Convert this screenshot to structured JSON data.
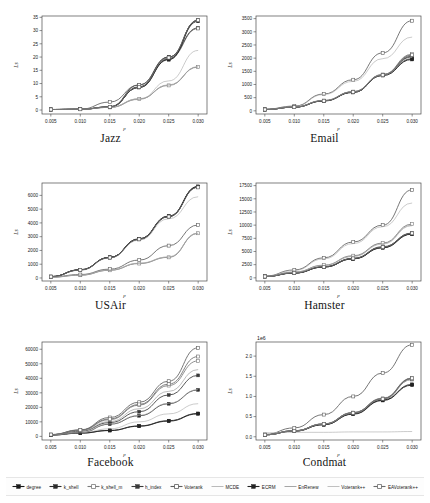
{
  "figure": {
    "xlabel": "p",
    "ylabel": "L_s",
    "xticks": [
      "0.005",
      "0.010",
      "0.015",
      "0.020",
      "0.025",
      "0.030"
    ],
    "x_values": [
      0.005,
      0.01,
      0.015,
      0.02,
      0.025,
      0.03
    ]
  },
  "legend": {
    "position": "bottom",
    "entries": [
      {
        "label": "degree",
        "marker": "plus-filled",
        "color": "#1a1a1a"
      },
      {
        "label": "k_shell",
        "marker": "plus-filled",
        "color": "#2b2b2b"
      },
      {
        "label": "k_shell_m",
        "marker": "plus-open",
        "color": "#7c7c7c"
      },
      {
        "label": "h_index",
        "marker": "plus-filled",
        "color": "#3a3a3a"
      },
      {
        "label": "Voterank",
        "marker": "plus-open",
        "color": "#5e5e5e"
      },
      {
        "label": "MCDE",
        "marker": "line",
        "color": "#a8a8a8"
      },
      {
        "label": "ECRM",
        "marker": "plus-filled",
        "color": "#222222"
      },
      {
        "label": "EnRenew",
        "marker": "line",
        "color": "#8f8f8f"
      },
      {
        "label": "Voterank++",
        "marker": "line",
        "color": "#b0b0b0"
      },
      {
        "label": "EAVoterank++",
        "marker": "plus-open",
        "color": "#6b6b6b"
      }
    ]
  },
  "chart_data": [
    {
      "type": "line",
      "title": "Jazz",
      "xlabel": "p",
      "ylabel": "L_s",
      "x": [
        0.005,
        0.01,
        0.015,
        0.02,
        0.025,
        0.03
      ],
      "xticklabels": [
        "0.005",
        "0.010",
        "0.015",
        "0.020",
        "0.025",
        "0.030"
      ],
      "yticks": [
        0,
        5,
        10,
        15,
        20,
        25,
        30,
        35
      ],
      "yticklabels": [
        "0",
        "5",
        "10",
        "15",
        "20",
        "25",
        "30",
        "35"
      ],
      "ylim": [
        -1.5,
        35.5
      ],
      "xlim": [
        0.0035,
        0.0315
      ],
      "grid": false,
      "exponent": "",
      "series": [
        {
          "name": "degree",
          "values": [
            0.2,
            0.3,
            1.2,
            8.5,
            19.0,
            34.0
          ]
        },
        {
          "name": "k_shell",
          "values": [
            0.2,
            0.3,
            1.1,
            8.8,
            20.0,
            33.8
          ]
        },
        {
          "name": "k_shell_m",
          "values": [
            0.2,
            0.3,
            1.0,
            4.2,
            9.3,
            16.3
          ]
        },
        {
          "name": "h_index",
          "values": [
            0.2,
            0.3,
            1.2,
            9.5,
            20.0,
            31.0
          ]
        },
        {
          "name": "Voterank",
          "values": [
            0.2,
            0.3,
            3.0,
            9.5,
            19.5,
            30.8
          ]
        },
        {
          "name": "MCDE",
          "values": [
            0.2,
            0.3,
            1.0,
            4.0,
            11.0,
            22.5
          ]
        },
        {
          "name": "ECRM",
          "values": [
            0.2,
            0.3,
            1.1,
            8.6,
            19.2,
            33.5
          ]
        },
        {
          "name": "EnRenew",
          "values": [
            0.2,
            0.3,
            1.0,
            4.1,
            9.5,
            16.2
          ]
        },
        {
          "name": "Voterank++",
          "values": [
            0.2,
            0.3,
            1.1,
            4.3,
            9.4,
            16.4
          ]
        },
        {
          "name": "EAVoterank++",
          "values": [
            0.2,
            0.3,
            1.2,
            8.7,
            19.8,
            33.9
          ]
        }
      ]
    },
    {
      "type": "line",
      "title": "Email",
      "xlabel": "p",
      "ylabel": "L_s",
      "x": [
        0.005,
        0.01,
        0.015,
        0.02,
        0.025,
        0.03
      ],
      "xticklabels": [
        "0.005",
        "0.010",
        "0.015",
        "0.020",
        "0.025",
        "0.030"
      ],
      "yticks": [
        0,
        500,
        1000,
        1500,
        2000,
        2500,
        3000,
        3500
      ],
      "yticklabels": [
        "0",
        "500",
        "1000",
        "1500",
        "2000",
        "2500",
        "3000",
        "3500"
      ],
      "ylim": [
        -120,
        3600
      ],
      "xlim": [
        0.0035,
        0.0315
      ],
      "grid": false,
      "exponent": "",
      "series": [
        {
          "name": "degree",
          "values": [
            50,
            140,
            380,
            720,
            1370,
            2050
          ]
        },
        {
          "name": "k_shell",
          "values": [
            50,
            140,
            380,
            700,
            1350,
            1980
          ]
        },
        {
          "name": "k_shell_m",
          "values": [
            55,
            150,
            390,
            730,
            1380,
            2150
          ]
        },
        {
          "name": "h_index",
          "values": [
            50,
            145,
            385,
            710,
            1360,
            2080
          ]
        },
        {
          "name": "Voterank",
          "values": [
            60,
            180,
            640,
            1180,
            2200,
            3420
          ]
        },
        {
          "name": "MCDE",
          "values": [
            55,
            160,
            620,
            1120,
            1980,
            2800
          ]
        },
        {
          "name": "ECRM",
          "values": [
            50,
            140,
            375,
            700,
            1340,
            1950
          ]
        },
        {
          "name": "EnRenew",
          "values": [
            52,
            145,
            390,
            720,
            1370,
            2100
          ]
        },
        {
          "name": "Voterank++",
          "values": [
            52,
            148,
            395,
            725,
            1365,
            2030
          ]
        },
        {
          "name": "EAVoterank++",
          "values": [
            50,
            142,
            382,
            715,
            1355,
            2120
          ]
        }
      ]
    },
    {
      "type": "line",
      "title": "USAir",
      "xlabel": "p",
      "ylabel": "L_s",
      "x": [
        0.005,
        0.01,
        0.015,
        0.02,
        0.025,
        0.03
      ],
      "xticklabels": [
        "0.005",
        "0.010",
        "0.015",
        "0.020",
        "0.025",
        "0.030"
      ],
      "yticks": [
        0,
        1000,
        2000,
        3000,
        4000,
        5000,
        6000
      ],
      "yticklabels": [
        "0",
        "1000",
        "2000",
        "3000",
        "4000",
        "5000",
        "6000"
      ],
      "ylim": [
        -220,
        6900
      ],
      "xlim": [
        0.0035,
        0.0315
      ],
      "grid": false,
      "exponent": "",
      "series": [
        {
          "name": "degree",
          "values": [
            100,
            600,
            1500,
            2850,
            4500,
            6650
          ]
        },
        {
          "name": "k_shell",
          "values": [
            95,
            580,
            1480,
            2800,
            4450,
            6600
          ]
        },
        {
          "name": "k_shell_m",
          "values": [
            60,
            200,
            560,
            1050,
            1500,
            3250
          ]
        },
        {
          "name": "h_index",
          "values": [
            100,
            590,
            1490,
            2820,
            4480,
            6620
          ]
        },
        {
          "name": "Voterank",
          "values": [
            70,
            250,
            640,
            1300,
            2350,
            3850
          ]
        },
        {
          "name": "MCDE",
          "values": [
            90,
            560,
            1450,
            2750,
            4300,
            5900
          ]
        },
        {
          "name": "ECRM",
          "values": [
            100,
            595,
            1495,
            2830,
            4470,
            6640
          ]
        },
        {
          "name": "EnRenew",
          "values": [
            60,
            210,
            570,
            1060,
            1520,
            3230
          ]
        },
        {
          "name": "Voterank++",
          "values": [
            62,
            215,
            575,
            1080,
            1530,
            3270
          ]
        },
        {
          "name": "EAVoterank++",
          "values": [
            98,
            585,
            1485,
            2810,
            4460,
            6580
          ]
        }
      ]
    },
    {
      "type": "line",
      "title": "Hamster",
      "xlabel": "p",
      "ylabel": "L_s",
      "x": [
        0.005,
        0.01,
        0.015,
        0.02,
        0.025,
        0.03
      ],
      "xticklabels": [
        "0.005",
        "0.010",
        "0.015",
        "0.020",
        "0.025",
        "0.030"
      ],
      "yticks": [
        0,
        2500,
        5000,
        7500,
        10000,
        12500,
        15000,
        17500
      ],
      "yticklabels": [
        "0",
        "2500",
        "5000",
        "7500",
        "10000",
        "12500",
        "15000",
        "17500"
      ],
      "ylim": [
        -600,
        18000
      ],
      "xlim": [
        0.0035,
        0.0315
      ],
      "grid": false,
      "exponent": "",
      "series": [
        {
          "name": "degree",
          "values": [
            250,
            900,
            2050,
            3600,
            5700,
            8300
          ]
        },
        {
          "name": "k_shell",
          "values": [
            260,
            950,
            2100,
            3700,
            5900,
            8500
          ]
        },
        {
          "name": "k_shell_m",
          "values": [
            280,
            1100,
            2400,
            4200,
            6600,
            10200
          ]
        },
        {
          "name": "h_index",
          "values": [
            255,
            920,
            2080,
            3650,
            5800,
            8400
          ]
        },
        {
          "name": "Voterank",
          "values": [
            320,
            1500,
            3800,
            6800,
            10000,
            16700
          ]
        },
        {
          "name": "MCDE",
          "values": [
            300,
            1400,
            3600,
            6500,
            9700,
            14200
          ]
        },
        {
          "name": "ECRM",
          "values": [
            250,
            910,
            2060,
            3620,
            5750,
            8350
          ]
        },
        {
          "name": "EnRenew",
          "values": [
            275,
            1050,
            2350,
            4100,
            6500,
            10000
          ]
        },
        {
          "name": "Voterank++",
          "values": [
            270,
            1000,
            2300,
            4050,
            6400,
            9900
          ]
        },
        {
          "name": "EAVoterank++",
          "values": [
            258,
            930,
            2090,
            3680,
            5850,
            8450
          ]
        }
      ]
    },
    {
      "type": "line",
      "title": "Facebook",
      "xlabel": "p",
      "ylabel": "L_s",
      "x": [
        0.005,
        0.01,
        0.015,
        0.02,
        0.025,
        0.03
      ],
      "xticklabels": [
        "0.005",
        "0.010",
        "0.015",
        "0.020",
        "0.025",
        "0.030"
      ],
      "yticks": [
        0,
        10000,
        20000,
        30000,
        40000,
        50000,
        60000
      ],
      "yticklabels": [
        "0",
        "10000",
        "20000",
        "30000",
        "40000",
        "50000",
        "60000"
      ],
      "ylim": [
        -2500,
        65000
      ],
      "xlim": [
        0.0035,
        0.0315
      ],
      "grid": false,
      "exponent": "",
      "series": [
        {
          "name": "degree",
          "values": [
            900,
            2200,
            4000,
            7000,
            10500,
            15500
          ]
        },
        {
          "name": "k_shell",
          "values": [
            1100,
            2500,
            8400,
            14200,
            22500,
            32000
          ]
        },
        {
          "name": "k_shell_m",
          "values": [
            1200,
            4200,
            11500,
            21500,
            35000,
            52000
          ]
        },
        {
          "name": "h_index",
          "values": [
            1150,
            3500,
            9500,
            17000,
            28500,
            42000
          ]
        },
        {
          "name": "Voterank",
          "values": [
            1250,
            4500,
            13000,
            23500,
            38000,
            61000
          ]
        },
        {
          "name": "MCDE",
          "values": [
            1000,
            2400,
            5200,
            10000,
            15500,
            22500
          ]
        },
        {
          "name": "ECRM",
          "values": [
            950,
            2300,
            4100,
            7200,
            10800,
            15800
          ]
        },
        {
          "name": "EnRenew",
          "values": [
            1180,
            3800,
            10200,
            19000,
            31000,
            46000
          ]
        },
        {
          "name": "Voterank++",
          "values": [
            1050,
            2450,
            8600,
            14500,
            22800,
            32200
          ]
        },
        {
          "name": "EAVoterank++",
          "values": [
            1220,
            4300,
            12000,
            22000,
            36000,
            55000
          ]
        }
      ]
    },
    {
      "type": "line",
      "title": "Condmat",
      "xlabel": "p",
      "ylabel": "L_s",
      "x": [
        0.005,
        0.01,
        0.015,
        0.02,
        0.025,
        0.03
      ],
      "xticklabels": [
        "0.005",
        "0.010",
        "0.015",
        "0.020",
        "0.025",
        "0.030"
      ],
      "yticks": [
        0.0,
        0.5,
        1.0,
        1.5,
        2.0
      ],
      "yticklabels": [
        "0.0",
        "0.5",
        "1.0",
        "1.5",
        "2.0"
      ],
      "ylim": [
        -0.08,
        2.35
      ],
      "xlim": [
        0.0035,
        0.0315
      ],
      "grid": false,
      "exponent": "1e6",
      "series": [
        {
          "name": "degree",
          "values": [
            0.05,
            0.14,
            0.3,
            0.56,
            0.9,
            1.28
          ]
        },
        {
          "name": "k_shell",
          "values": [
            0.05,
            0.15,
            0.32,
            0.6,
            0.95,
            1.45
          ]
        },
        {
          "name": "k_shell_m",
          "values": [
            0.05,
            0.14,
            0.31,
            0.58,
            0.93,
            1.42
          ]
        },
        {
          "name": "h_index",
          "values": [
            0.05,
            0.15,
            0.31,
            0.59,
            0.94,
            1.44
          ]
        },
        {
          "name": "Voterank",
          "values": [
            0.06,
            0.22,
            0.55,
            1.0,
            1.58,
            2.28
          ]
        },
        {
          "name": "MCDE",
          "values": [
            0.1,
            0.11,
            0.11,
            0.12,
            0.12,
            0.13
          ]
        },
        {
          "name": "ECRM",
          "values": [
            0.05,
            0.14,
            0.3,
            0.57,
            0.91,
            1.3
          ]
        },
        {
          "name": "EnRenew",
          "values": [
            0.05,
            0.15,
            0.32,
            0.6,
            0.96,
            1.46
          ]
        },
        {
          "name": "Voterank++",
          "values": [
            0.05,
            0.145,
            0.315,
            0.585,
            0.935,
            1.43
          ]
        },
        {
          "name": "EAVoterank++",
          "values": [
            0.05,
            0.148,
            0.318,
            0.592,
            0.942,
            1.45
          ]
        }
      ]
    }
  ]
}
